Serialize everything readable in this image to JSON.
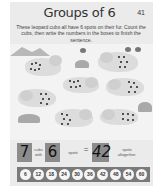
{
  "header": {
    "title": "Groups of 6",
    "page_number": "41",
    "instructions": "These leopard cubs all have 6 spots on their fur. Count the cubs, then write the numbers in the boxes to finish the sentence."
  },
  "illustration": {
    "subject": "leopard cubs",
    "cub_count": 7,
    "spots_per_cub": 6
  },
  "sentence": {
    "cubs_value": "7",
    "cubs_label": "cubs with",
    "spots_value": "6",
    "spots_label": "spots",
    "equals": "=",
    "total_value": "42",
    "total_label": "spots altogether."
  },
  "counting_strip": {
    "numbers": [
      "6",
      "12",
      "18",
      "24",
      "30",
      "36",
      "42",
      "48",
      "54",
      "60"
    ]
  },
  "colors": {
    "page_bg": "#ebebeb",
    "answer_box": "#8c8c8c",
    "strip_bg": "#7a7a7a"
  }
}
